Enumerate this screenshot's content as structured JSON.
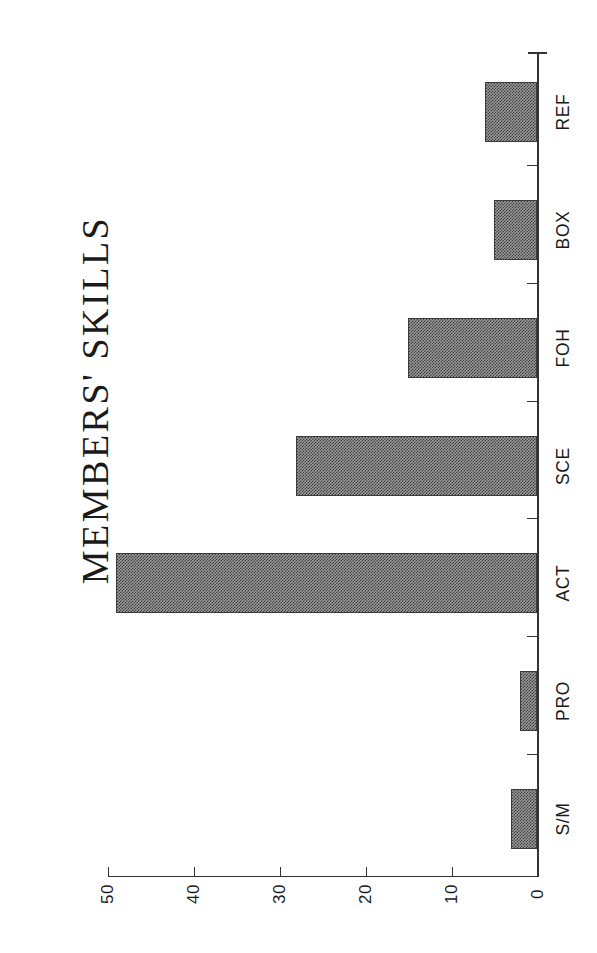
{
  "chart_data": {
    "type": "bar",
    "orientation": "horizontal",
    "title": "MEMBERS' SKILLS",
    "xlabel": "",
    "ylabel": "",
    "categories": [
      "S/M",
      "PRO",
      "ACT",
      "SCE",
      "FOH",
      "BOX",
      "REF"
    ],
    "values": [
      3,
      2,
      49,
      28,
      15,
      5,
      6
    ],
    "value_axis_ticks": [
      "0",
      "10",
      "20",
      "30",
      "40",
      "50"
    ],
    "value_axis_tick_values": [
      0,
      10,
      20,
      30,
      40,
      50
    ],
    "ylim": [
      0,
      50
    ],
    "grid": false,
    "legend": false,
    "bar_fill": "#9a9a9a",
    "bar_edge": "#3a3a3a",
    "axis_color": "#333333",
    "background": "#ffffff",
    "note": "Chart is rendered rotated 90 degrees; value axis 0-50 runs right-to-left along the bottom, categories run bottom-to-top along the right spine."
  }
}
